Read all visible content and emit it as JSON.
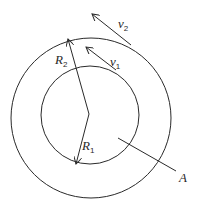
{
  "diagram": {
    "type": "concentric-circles-rotation",
    "colors": {
      "stroke": "#2a2a2a",
      "background": "#ffffff"
    },
    "circles": [
      {
        "name": "outer",
        "cx": 91,
        "cy": 118,
        "r": 80
      },
      {
        "name": "inner",
        "cx": 90,
        "cy": 115,
        "r": 49
      }
    ],
    "labels": {
      "R2": {
        "base": "R",
        "sub": "2"
      },
      "R1": {
        "base": "R",
        "sub": "1"
      },
      "v2": {
        "base": "v",
        "sub": "2"
      },
      "v1": {
        "base": "v",
        "sub": "1"
      },
      "A": {
        "base": "A"
      }
    }
  }
}
